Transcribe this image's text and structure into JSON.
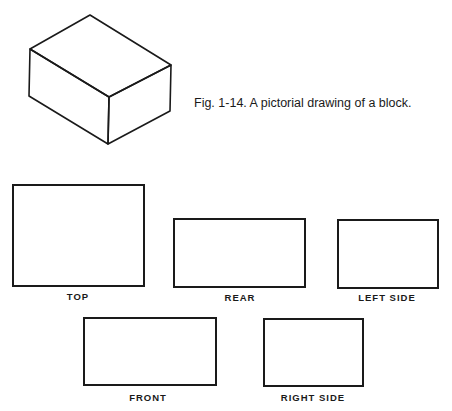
{
  "caption": "Fig. 1-14.   A pictorial drawing of a block.",
  "pictorial": {
    "name": "isometric-block",
    "vertices": {
      "top_back": [
        90,
        15
      ],
      "top_left": [
        30,
        49
      ],
      "top_right": [
        171,
        65
      ],
      "top_front": [
        109,
        97
      ],
      "bottom_left": [
        29,
        96
      ],
      "bottom_front": [
        108,
        144
      ],
      "bottom_right": [
        170,
        111
      ]
    }
  },
  "views": [
    {
      "id": "top",
      "label": "TOP",
      "x": 12,
      "y": 184,
      "w": 133,
      "h": 103,
      "label_x": 78,
      "label_y": 291
    },
    {
      "id": "rear",
      "label": "REAR",
      "x": 173,
      "y": 218,
      "w": 133,
      "h": 70,
      "label_x": 240,
      "label_y": 292
    },
    {
      "id": "left-side",
      "label": "LEFT SIDE",
      "x": 337,
      "y": 219,
      "w": 102,
      "h": 70,
      "label_x": 387,
      "label_y": 292
    },
    {
      "id": "front",
      "label": "FRONT",
      "x": 83,
      "y": 317,
      "w": 134,
      "h": 69,
      "label_x": 148,
      "label_y": 392
    },
    {
      "id": "right-side",
      "label": "RIGHT SIDE",
      "x": 263,
      "y": 318,
      "w": 101,
      "h": 69,
      "label_x": 313,
      "label_y": 392
    }
  ]
}
